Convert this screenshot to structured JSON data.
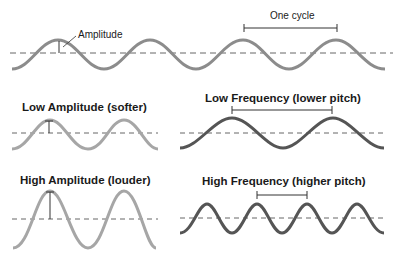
{
  "labels": {
    "amplitude": "Amplitude",
    "one_cycle": "One cycle",
    "low_amplitude": "Low Amplitude (softer)",
    "low_frequency": "Low Frequency (lower pitch)",
    "high_amplitude": "High Amplitude (louder)",
    "high_frequency": "High Frequency (higher pitch)"
  },
  "colors": {
    "amplitude_wave": "#a6a6a6",
    "top_wave": "#8c8c8c",
    "frequency_wave": "#555555",
    "baseline": "#666666",
    "annotation": "#333333"
  }
}
